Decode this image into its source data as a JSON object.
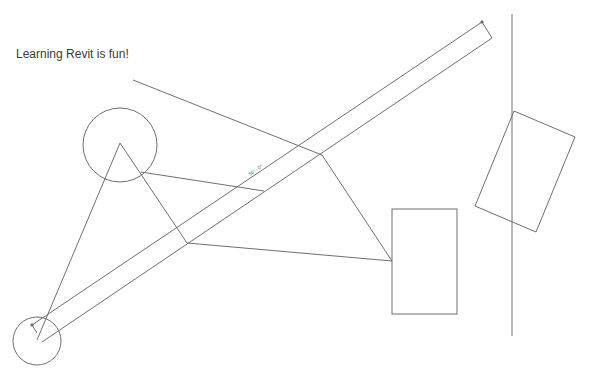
{
  "view": {
    "type": "Revit drafting/plan view",
    "background": "#ffffff",
    "line_color": "#6e6e6e"
  },
  "text_note": {
    "label": "Learning Revit is fun!"
  },
  "dimension": {
    "label": "50' - 0\""
  },
  "elements": [
    {
      "name": "large-circle",
      "shape": "circle",
      "cx": 120,
      "cy": 145,
      "r": 37
    },
    {
      "name": "small-circle",
      "shape": "circle",
      "cx": 37,
      "cy": 341,
      "r": 24
    },
    {
      "name": "diagonal-band",
      "shape": "polygon",
      "points": "32,325 482,22 492,38 42,342"
    },
    {
      "name": "rectangle",
      "shape": "rect",
      "x": 392,
      "y": 209,
      "w": 65,
      "h": 105
    },
    {
      "name": "rotated-rectangle",
      "shape": "polygon",
      "points": "514,111 575,137 536,232 475,206"
    },
    {
      "name": "vertical-line",
      "shape": "line",
      "x1": 512,
      "y1": 14,
      "x2": 512,
      "y2": 336
    }
  ]
}
